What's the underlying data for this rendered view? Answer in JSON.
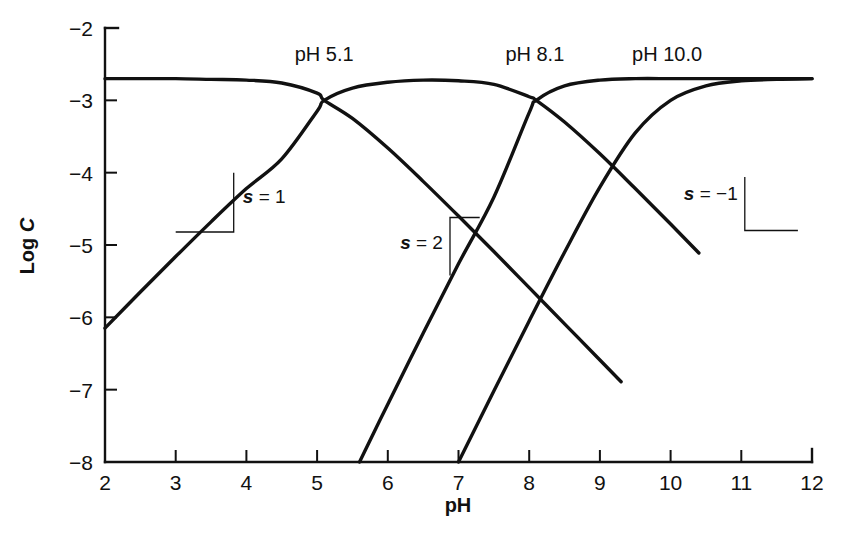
{
  "chart_data": {
    "type": "line",
    "title": "",
    "xlabel": "pH",
    "ylabel": "Log C",
    "xlim": [
      2,
      12
    ],
    "ylim": [
      -8,
      -2
    ],
    "xticks": [
      "2",
      "3",
      "4",
      "5",
      "6",
      "7",
      "8",
      "9",
      "10",
      "11",
      "12"
    ],
    "yticks": [
      "−2",
      "−3",
      "−4",
      "−5",
      "−6",
      "−7",
      "−8"
    ],
    "grid": false,
    "legend_position": "none",
    "total_log_c": -2.7,
    "pka_values": [
      5.1,
      8.1,
      10.0
    ],
    "annotations": [
      {
        "text": "pH 5.1",
        "x": 5.1,
        "y": -2.45
      },
      {
        "text": "pH 8.1",
        "x": 8.08,
        "y": -2.45
      },
      {
        "text": "pH 10.0",
        "x": 9.95,
        "y": -2.45
      }
    ],
    "slope_annotations": [
      {
        "text": "s = 1",
        "slope": 1,
        "x": 3.45,
        "y": -4.5
      },
      {
        "text": "s = 2",
        "slope": 2,
        "x": 6.15,
        "y": -5.15
      },
      {
        "text": "s = −1",
        "slope": -1,
        "x": 10.5,
        "y": -4.45
      }
    ],
    "series": [
      {
        "name": "H4A",
        "role": "fully-protonated",
        "x": [
          2,
          2.5,
          3,
          3.5,
          4,
          4.5,
          5,
          5.1,
          5.5,
          6,
          6.5,
          7,
          7.5,
          8,
          8.5,
          9,
          9.3
        ],
        "y": [
          -2.7,
          -2.7,
          -2.7,
          -2.71,
          -2.72,
          -2.76,
          -2.9,
          -3.0,
          -3.25,
          -3.66,
          -4.12,
          -4.6,
          -5.09,
          -5.59,
          -6.09,
          -6.59,
          -6.89
        ]
      },
      {
        "name": "H3A-",
        "role": "first-deprotonation",
        "x": [
          2,
          2.5,
          3,
          3.5,
          4,
          4.5,
          5,
          5.1,
          5.5,
          6,
          6.5,
          7,
          7.5,
          8,
          8.1,
          8.5,
          9,
          9.5,
          10,
          10.4
        ],
        "y": [
          -6.15,
          -5.65,
          -5.16,
          -4.68,
          -4.22,
          -3.81,
          -3.15,
          -3.0,
          -2.83,
          -2.75,
          -2.72,
          -2.73,
          -2.78,
          -2.95,
          -3.0,
          -3.3,
          -3.74,
          -4.22,
          -4.71,
          -5.11
        ]
      },
      {
        "name": "H2A2-",
        "role": "second-deprotonation",
        "x": [
          5.6,
          6,
          6.5,
          7,
          7.5,
          8,
          8.1,
          8.5,
          9,
          9.5,
          10,
          10.4,
          11,
          11.5,
          12
        ],
        "y": [
          -8.0,
          -7.2,
          -6.22,
          -5.26,
          -4.34,
          -3.17,
          -3.0,
          -2.8,
          -2.72,
          -2.7,
          -2.7,
          -2.7,
          -2.7,
          -2.7,
          -2.7
        ]
      },
      {
        "name": "HA3-",
        "role": "third-deprotonation",
        "x": [
          7,
          7.5,
          8,
          8.5,
          9,
          9.5,
          10,
          10.5,
          11,
          11.5,
          12
        ],
        "y": [
          -8.0,
          -7.02,
          -6.05,
          -5.1,
          -4.2,
          -3.45,
          -3.0,
          -2.8,
          -2.73,
          -2.71,
          -2.7
        ]
      }
    ]
  },
  "figure": {
    "background_color": "#ffffff",
    "line_color": "#111111"
  }
}
